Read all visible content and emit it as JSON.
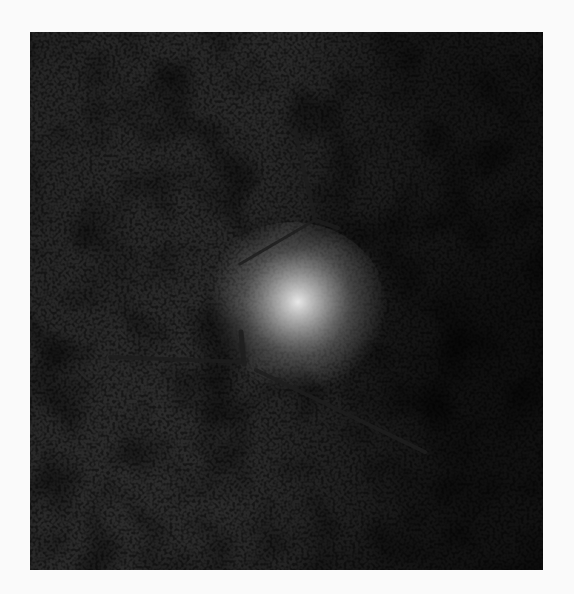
{
  "image": {
    "kind": "astronomical-photograph",
    "tone": "grayscale",
    "subject": "faint diffuse object in dense star field",
    "colors": {
      "frame_background": "#fafafa",
      "sky_mid": "#8a8a8a",
      "sky_dark": "#3a3a3a",
      "sky_light": "#b8b8b8",
      "glow": "#e6e6e6",
      "marker": "#1e1e1e"
    },
    "bounds": {
      "x": 30,
      "y": 32,
      "width": 513,
      "height": 538
    },
    "bright_spot": {
      "cx": 268,
      "cy": 270
    },
    "markers": [
      {
        "name": "upper-pointer",
        "segments": [
          [
            [
              265,
              98
            ],
            [
              285,
              188
            ]
          ],
          [
            [
              285,
              188
            ],
            [
              308,
              196
            ]
          ],
          [
            [
              285,
              188
            ],
            [
              210,
              232
            ]
          ]
        ]
      },
      {
        "name": "lower-pointer",
        "segments": [
          [
            [
              80,
              325
            ],
            [
              215,
              330
            ]
          ],
          [
            [
              211,
              300
            ],
            [
              214,
              332
            ]
          ],
          [
            [
              226,
              338
            ],
            [
              395,
              420
            ]
          ]
        ]
      }
    ]
  }
}
